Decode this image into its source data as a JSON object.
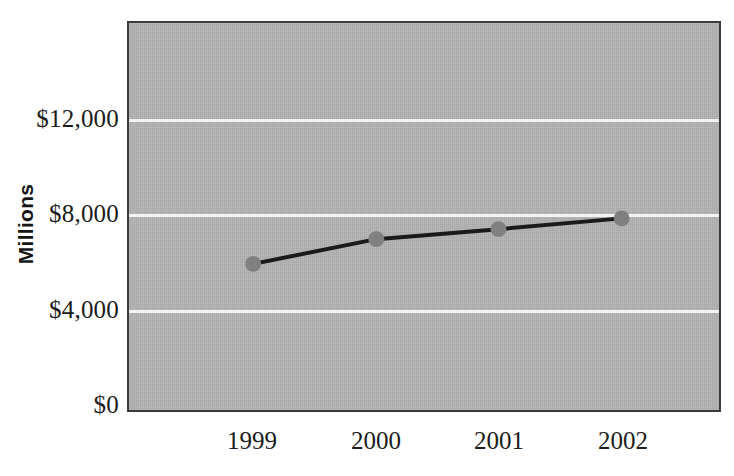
{
  "chart_data": {
    "type": "line",
    "title": "",
    "subtitle": "",
    "xlabel": "",
    "ylabel": "Millions",
    "categories": [
      "1999",
      "2000",
      "2001",
      "2002"
    ],
    "values": [
      5900,
      6950,
      7370,
      7830
    ],
    "series": [
      {
        "name": "Millions",
        "values": [
          5900,
          6950,
          7370,
          7830
        ]
      }
    ],
    "ylim": [
      0,
      14000
    ],
    "y_ticks": [
      0,
      4000,
      8000,
      12000
    ],
    "y_tick_labels": [
      "$0",
      "$4,000",
      "$8,000",
      "$12,000"
    ],
    "x_tick_labels": [
      "1999",
      "2000",
      "2001",
      "2002"
    ],
    "grid": true,
    "gridline_color": "#f2f2f2",
    "legend": false,
    "legend_position": "none",
    "plot_background": "#b2b2b2",
    "line_color": "#1a1a1a",
    "marker_color": "#808080",
    "marker_shape": "circle",
    "axis_border_color": "#3a3a3a",
    "text_color": "#1c1c1c",
    "annotations": []
  },
  "axes": {
    "y": {
      "title": "Millions",
      "ticks": [
        {
          "label": "$12,000",
          "value": 12000
        },
        {
          "label": "$8,000",
          "value": 8000
        },
        {
          "label": "$4,000",
          "value": 4000
        },
        {
          "label": "$0",
          "value": 0
        }
      ]
    },
    "x": {
      "title": "",
      "ticks": [
        {
          "label": "1999"
        },
        {
          "label": "2000"
        },
        {
          "label": "2001"
        },
        {
          "label": "2002"
        }
      ]
    }
  }
}
